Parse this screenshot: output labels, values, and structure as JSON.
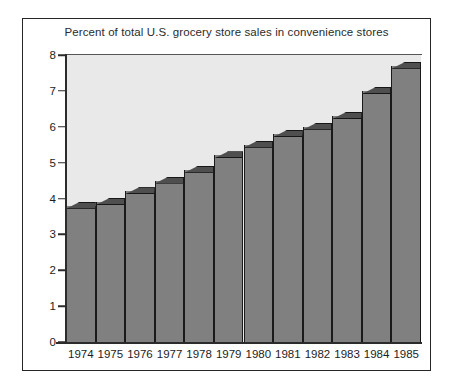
{
  "chart_data": {
    "type": "bar",
    "title": "Percent of total U.S. grocery store sales in convenience stores",
    "xlabel": "",
    "ylabel": "",
    "categories": [
      "1974",
      "1975",
      "1976",
      "1977",
      "1978",
      "1979",
      "1980",
      "1981",
      "1982",
      "1983",
      "1984",
      "1985"
    ],
    "values": [
      3.8,
      3.9,
      4.2,
      4.5,
      4.8,
      5.2,
      5.5,
      5.8,
      6.0,
      6.3,
      7.0,
      7.7
    ],
    "ylim": [
      0,
      8
    ],
    "yticks": [
      "0",
      "1",
      "2",
      "3",
      "4",
      "5",
      "6",
      "7",
      "8"
    ],
    "grid": false,
    "legend": "none",
    "style": "3d-shaded-bars",
    "colors": {
      "bar_face": "#808080",
      "bar_top": "#4f4f4f",
      "bar_edge": "#1a1a1a",
      "plot_background": "#e9e9e9",
      "page_background": "#ffffff",
      "frame": "#262626",
      "text": "#1d1d1d"
    }
  }
}
